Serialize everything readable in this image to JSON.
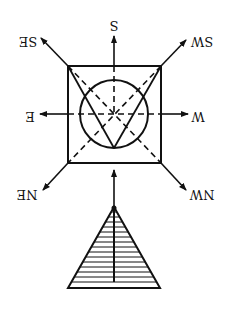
{
  "diagram": {
    "labels": {
      "s": "S",
      "se": "SE",
      "sw": "SW",
      "e": "E",
      "w": "W",
      "ne": "NE",
      "nw": "NW"
    },
    "colors": {
      "stroke": "#111111",
      "background": "#ffffff"
    }
  }
}
